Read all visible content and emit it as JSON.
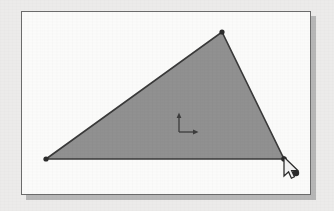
{
  "document": {
    "title": "Triangle Sketch Canvas",
    "background_color": "#ecebea"
  },
  "panel": {
    "name": "drawing-canvas",
    "background_color": "#fbfbfa",
    "border_color": "#6b6b6b",
    "shadow_color": "#b7b7b7",
    "x": 21,
    "y": 11,
    "width": 290,
    "height": 184
  },
  "shapes": {
    "triangle": {
      "label": "triangle",
      "fill_color": "#919191",
      "stroke_color": "#3a3a3a",
      "stroke_width": 1.6,
      "vertices": [
        {
          "name": "vertex-left",
          "x": 24,
          "y": 147
        },
        {
          "name": "vertex-top",
          "x": 200,
          "y": 20
        },
        {
          "name": "vertex-right",
          "x": 262,
          "y": 147
        }
      ],
      "vertex_marker": {
        "shape": "circle",
        "radius": 2.6,
        "color": "#2c2c2c"
      }
    },
    "axis_gizmo": {
      "label": "origin-axis-marker",
      "origin_x": 157,
      "origin_y": 120,
      "arm_length": 16,
      "color": "#3d3d3d",
      "axes": [
        "y-up",
        "x-right"
      ]
    },
    "point_marker": {
      "label": "snap-point",
      "x": 274,
      "y": 161,
      "radius": 3.2,
      "color": "#2b2b2b"
    }
  },
  "cursor": {
    "label": "mouse-pointer",
    "type": "arrow",
    "x": 262,
    "y": 147,
    "fill_color": "#f2f2f2",
    "outline_color": "#2a2a2a"
  },
  "accessibility": {
    "figure_description": "Gray filled triangle on a white drawing canvas with a coordinate axis marker, a mouse arrow cursor at the lower-right vertex, and a small round point marker."
  }
}
